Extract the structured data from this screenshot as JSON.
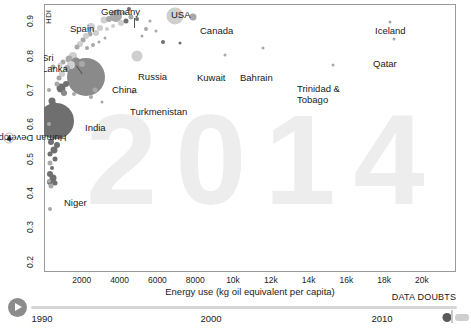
{
  "chart_data": {
    "type": "scatter",
    "title": "",
    "watermark_year": "2014",
    "xlabel": "Energy use (kg oil equivalent per capita)",
    "ylabel": "Human Development Index",
    "y_axis_top_label": "HDI",
    "xlim": [
      0,
      21800
    ],
    "ylim": [
      0.17,
      0.95
    ],
    "xticks": [
      "2000",
      "4000",
      "6000",
      "8000",
      "10k",
      "12k",
      "14k",
      "16k",
      "18k",
      "20k"
    ],
    "xtick_values": [
      2000,
      4000,
      6000,
      8000,
      10000,
      12000,
      14000,
      16000,
      18000,
      20000
    ],
    "yticks": [
      "0.2",
      "0.3",
      "0.4",
      "0.5",
      "0.6",
      "0.7",
      "0.8",
      "0.9"
    ],
    "ytick_values": [
      0.2,
      0.3,
      0.4,
      0.5,
      0.6,
      0.7,
      0.8,
      0.9
    ],
    "grid": false,
    "legend": "none",
    "bubble_size_meaning": "population",
    "labeled_points": [
      {
        "name": "Germany",
        "x": 3800,
        "y": 0.916
      },
      {
        "name": "Spain",
        "x": 2500,
        "y": 0.884
      },
      {
        "name": "USA",
        "x": 6950,
        "y": 0.915
      },
      {
        "name": "Canada",
        "x": 7900,
        "y": 0.913
      },
      {
        "name": "Iceland",
        "x": 18300,
        "y": 0.899
      },
      {
        "name": "Qatar",
        "x": 18500,
        "y": 0.847
      },
      {
        "name": "Sri Lanka",
        "x": 500,
        "y": 0.766
      },
      {
        "name": "Russia",
        "x": 4900,
        "y": 0.798
      },
      {
        "name": "Kuwait",
        "x": 9600,
        "y": 0.803
      },
      {
        "name": "Bahrain",
        "x": 11600,
        "y": 0.821
      },
      {
        "name": "Trinidad & Tobago",
        "x": 15300,
        "y": 0.772
      },
      {
        "name": "China",
        "x": 2240,
        "y": 0.738
      },
      {
        "name": "Turkmenistan",
        "x": 4700,
        "y": 0.695
      },
      {
        "name": "India",
        "x": 640,
        "y": 0.61
      },
      {
        "name": "Niger",
        "x": 320,
        "y": 0.353
      }
    ]
  },
  "axes": {
    "y_title": "Human Development Index",
    "y_caret": "▾",
    "y_info": "?",
    "y_top_label": "HDI",
    "x_title": "Energy use (kg oil equivalent per capita)"
  },
  "timeline": {
    "play_label": "play",
    "labels": [
      "1990",
      "2000",
      "2010"
    ],
    "label_values": [
      1990,
      2000,
      2010
    ],
    "current_year": "2014",
    "data_doubts": "DATA DOUBTS"
  },
  "colors": {
    "bubble_asia": "#8a8a8a",
    "bubble_light": "#cfcfcf",
    "bubble_mid": "#a8a8a8",
    "bubble_dark": "#6f6f6f",
    "frame": "#9a9a9a",
    "watermark": "#ededed",
    "text": "#1a1a1a",
    "play": "#8c8c8c",
    "track": "#d6d6d6"
  }
}
